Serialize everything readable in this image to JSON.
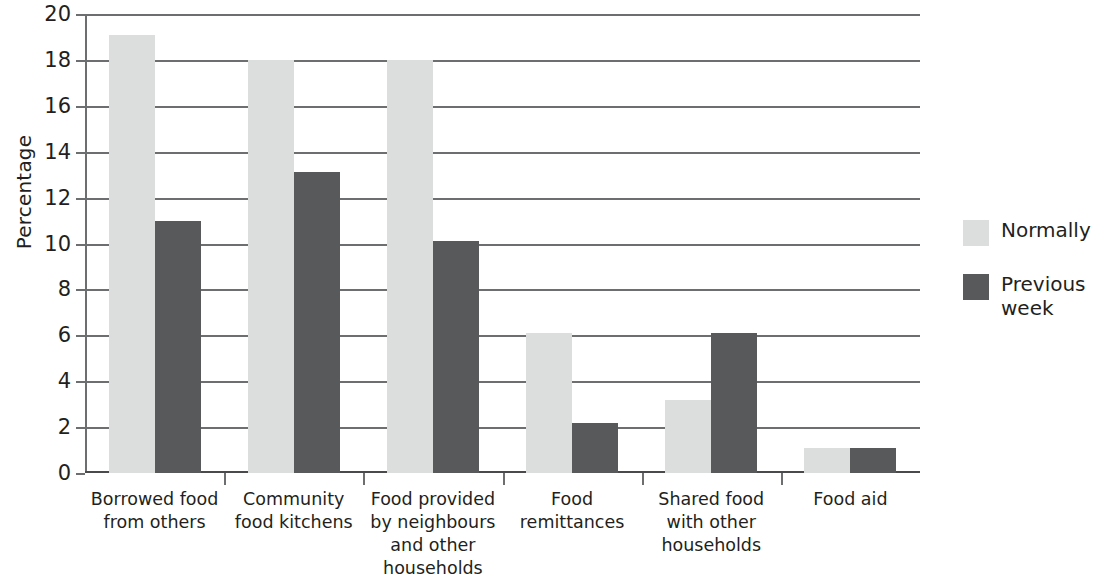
{
  "chart_data": {
    "type": "bar",
    "title": "",
    "subtitle": "",
    "xlabel": "",
    "ylabel": "Percentage",
    "ylim": [
      0,
      20
    ],
    "ytick_step": 2,
    "yticks": [
      "20",
      "18",
      "16",
      "14",
      "12",
      "10",
      "8",
      "6",
      "4",
      "2",
      "0"
    ],
    "grid": true,
    "legend_position": "right",
    "categories": [
      "Borrowed food\nfrom others",
      "Community\nfood kitchens",
      "Food provided\nby neighbours\nand other\nhouseholds",
      "Food\nremittances",
      "Shared food\nwith other\nhouseholds",
      "Food aid"
    ],
    "category_lines": [
      [
        "Borrowed food",
        "from others"
      ],
      [
        "Community",
        "food kitchens"
      ],
      [
        "Food provided",
        "by neighbours",
        "and other",
        "households"
      ],
      [
        "Food",
        "remittances"
      ],
      [
        "Shared food",
        "with other",
        "households"
      ],
      [
        "Food aid"
      ]
    ],
    "series": [
      {
        "name": "Normally",
        "color": "#dcdddd",
        "values": [
          19.1,
          18.0,
          18.0,
          6.1,
          3.2,
          1.1
        ]
      },
      {
        "name": "Previous week",
        "color": "#58595b",
        "values": [
          11.0,
          13.1,
          10.1,
          2.2,
          6.1,
          1.1
        ]
      }
    ]
  },
  "legend": {
    "items": [
      {
        "label": "Normally",
        "lines": [
          "Normally"
        ],
        "color": "#dcdddd"
      },
      {
        "label": "Previous week",
        "lines": [
          "Previous",
          "week"
        ],
        "color": "#58595b"
      }
    ]
  },
  "colors": {
    "normally": "#dcdddd",
    "previous_week": "#58595b",
    "axis": "#6d6e70",
    "text": "#231f20",
    "background": "#ffffff"
  }
}
